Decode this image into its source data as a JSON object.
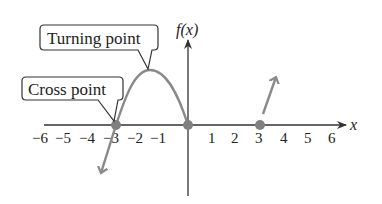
{
  "diagram": {
    "type": "polynomial-graph",
    "y_axis_label": "f(x)",
    "x_axis_label": "x",
    "x_ticks": [
      "−6",
      "−5",
      "−4",
      "−3",
      "−2",
      "−1",
      "1",
      "2",
      "3",
      "4",
      "5",
      "6"
    ],
    "x_tick_values": [
      -6,
      -5,
      -4,
      -3,
      -2,
      -1,
      1,
      2,
      3,
      4,
      5,
      6
    ],
    "callouts": [
      {
        "label": "Turning point",
        "target": "peak near x = −1.6"
      },
      {
        "label": "Cross point",
        "target": "x = −3"
      }
    ],
    "points": [
      {
        "x": -3,
        "y": 0
      },
      {
        "x": 0,
        "y": 0
      },
      {
        "x": 3,
        "y": 0
      }
    ],
    "colors": {
      "curve": "#8a8a8a",
      "axes": "#333333",
      "points": "#808080",
      "text": "#222222"
    }
  }
}
